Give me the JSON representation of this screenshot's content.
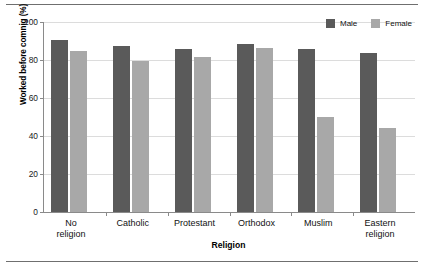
{
  "chart_data": {
    "type": "bar",
    "title": "",
    "xlabel": "Religion",
    "ylabel": "Worked before comnig (%)",
    "categories": [
      "No\nreligion",
      "Catholic",
      "Protestant",
      "Orthodox",
      "Muslim",
      "Eastern\nreligion"
    ],
    "series": [
      {
        "name": "Male",
        "color": "#5a5a5a",
        "values": [
          90.5,
          87.5,
          86.0,
          88.5,
          86.0,
          83.5
        ]
      },
      {
        "name": "Female",
        "color": "#a8a8a8",
        "values": [
          85.0,
          79.5,
          81.5,
          86.5,
          50.0,
          44.0
        ]
      }
    ],
    "ylim": [
      0,
      100
    ],
    "yticks": [
      0,
      20,
      40,
      60,
      80,
      100
    ],
    "ytick_labels": [
      "0",
      "20",
      "40",
      "60",
      "80",
      "100"
    ],
    "grid": true,
    "legend_position": "top-right"
  },
  "legend": {
    "entries": [
      {
        "label": "Male",
        "color": "#5a5a5a"
      },
      {
        "label": "Female",
        "color": "#a8a8a8"
      }
    ]
  }
}
